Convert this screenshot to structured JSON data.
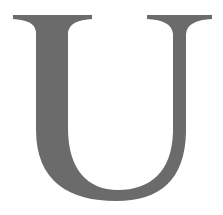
{
  "glyph": {
    "character": "U",
    "style": "serif capital letter",
    "color": "#6b6b6b",
    "background": "#ffffff"
  }
}
